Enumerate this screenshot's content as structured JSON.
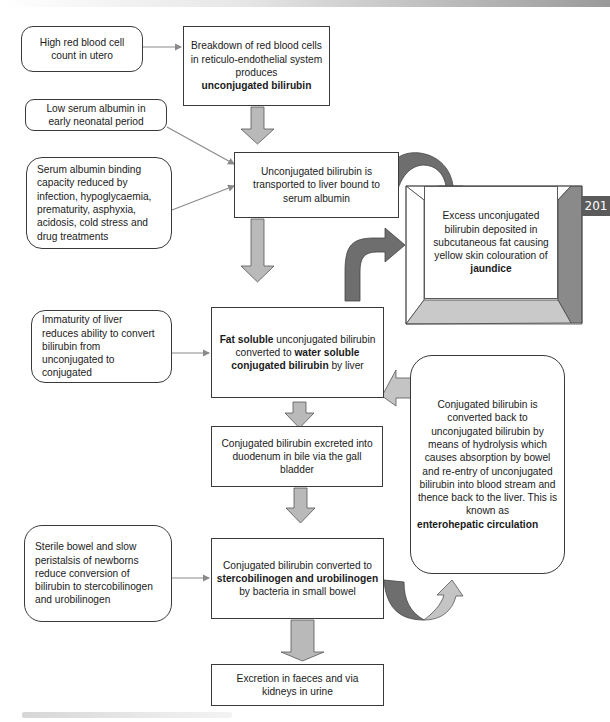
{
  "page": {
    "page_number": "201"
  },
  "diagram": {
    "main_flow": [
      {
        "id": "breakdown",
        "text": "Breakdown of red blood cells in reticulo-endothelial system produces",
        "bold": "unconjugated bilirubin"
      },
      {
        "id": "transport",
        "text": "Unconjugated bilirubin is transported to liver bound to serum albumin"
      },
      {
        "id": "liver_conversion",
        "bold_1": "Fat soluble",
        "text_1": " unconjugated bilirubin converted to ",
        "bold_2": "water soluble conjugated bilirubin",
        "text_2": " by liver"
      },
      {
        "id": "excretion_bile",
        "text": "Conjugated bilirubin excreted into duodenum in bile via the gall bladder"
      },
      {
        "id": "bowel_conversion",
        "text_1": "Conjugated bilirubin converted to",
        "bold": "stercobilinogen and urobilinogen",
        "text_2": "by bacteria in small bowel"
      },
      {
        "id": "final_excretion",
        "text": "Excretion in faeces and via kidneys in urine"
      }
    ],
    "factors": [
      {
        "id": "high_rbc",
        "text": "High red blood cell count in utero",
        "target": "breakdown"
      },
      {
        "id": "low_albumin",
        "text": "Low serum albumin in early neonatal period",
        "target": "transport"
      },
      {
        "id": "binding_capacity",
        "text": "Serum albumin binding capacity reduced by infection, hypoglycaemia, prematurity, asphyxia, acidosis, cold stress and drug treatments",
        "target": "transport"
      },
      {
        "id": "liver_immaturity",
        "text": "Immaturity of liver reduces ability to convert bilirubin from unconjugated to conjugated",
        "target": "liver_conversion"
      },
      {
        "id": "sterile_bowel",
        "text": "Sterile bowel and slow peristalsis of newborns reduce conversion of bilirubin to stercobilinogen and urobilinogen",
        "target": "bowel_conversion"
      }
    ],
    "jaundice": {
      "text": "Excess unconjugated bilirubin deposited in subcutaneous fat causing yellow skin colouration of",
      "bold": "jaundice"
    },
    "enterohepatic": {
      "text": "Conjugated bilirubin is converted back to unconjugated bilirubin by means of hydrolysis which causes absorption by bowel and re-entry of unconjugated bilirubin into blood stream and thence back to the liver. This is known as",
      "bold": "enterohepatic circulation"
    },
    "colors": {
      "block_arrow_fill": "#b9b9b9",
      "block_arrow_stroke": "#555555",
      "curved_arrow_dark": "#6e6e6e",
      "curved_arrow_light": "#bdbdbd",
      "connector_line": "#8a8a8a",
      "box_border": "#3a3a3a",
      "page_tab": "#5b5b5b"
    }
  }
}
